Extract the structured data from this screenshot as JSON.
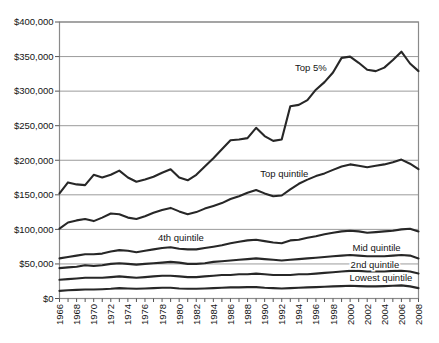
{
  "chart_data": {
    "type": "line",
    "title": "",
    "xlabel": "",
    "ylabel": "",
    "xlim": [
      1966,
      2008
    ],
    "ylim": [
      0,
      400000
    ],
    "grid": "horizontal",
    "legend": "inline-labels",
    "line_color": "#272727",
    "x": [
      1966,
      1967,
      1968,
      1969,
      1970,
      1971,
      1972,
      1973,
      1974,
      1975,
      1976,
      1977,
      1978,
      1979,
      1980,
      1981,
      1982,
      1983,
      1984,
      1985,
      1986,
      1987,
      1988,
      1989,
      1990,
      1991,
      1992,
      1993,
      1994,
      1995,
      1996,
      1997,
      1998,
      1999,
      2000,
      2001,
      2002,
      2003,
      2004,
      2005,
      2006,
      2007,
      2008
    ],
    "x_tick_values": [
      1966,
      1968,
      1970,
      1972,
      1974,
      1976,
      1978,
      1980,
      1982,
      1984,
      1986,
      1988,
      1990,
      1992,
      1994,
      1996,
      1998,
      2000,
      2002,
      2004,
      2006,
      2008
    ],
    "x_tick_labels": [
      "1966",
      "1968",
      "1970",
      "1972",
      "1974",
      "1976",
      "1978",
      "1980",
      "1982",
      "1984",
      "1986",
      "1988",
      "1990",
      "1992",
      "1994",
      "1996",
      "1998",
      "2000",
      "2002",
      "2004",
      "2006",
      "2008"
    ],
    "y_ticks": {
      "values": [
        0,
        50000,
        100000,
        150000,
        200000,
        250000,
        300000,
        350000,
        400000
      ],
      "labels": [
        "$0",
        "$50,000",
        "$100,000",
        "$150,000",
        "$200,000",
        "$250,000",
        "$300,000",
        "$350,000",
        "$400,000"
      ]
    },
    "series": [
      {
        "name": "Top 5%",
        "label": {
          "text": "Top 5%",
          "x": 1995.4,
          "y": 334000
        },
        "values": [
          152000,
          168000,
          165000,
          164000,
          179000,
          175000,
          179000,
          185000,
          175000,
          169000,
          172000,
          176000,
          182000,
          187000,
          175000,
          171000,
          179000,
          191000,
          203000,
          216000,
          229000,
          230000,
          232000,
          247000,
          235000,
          228000,
          230000,
          278000,
          280000,
          287000,
          302000,
          313000,
          327000,
          348000,
          350000,
          341000,
          331000,
          329000,
          334000,
          345000,
          357000,
          340000,
          329000
        ]
      },
      {
        "name": "Top quintile",
        "label": {
          "text": "Top quintile",
          "x": 1992.3,
          "y": 180000
        },
        "values": [
          101000,
          110000,
          113000,
          115000,
          112000,
          117000,
          123000,
          122000,
          117000,
          115000,
          119000,
          124000,
          128000,
          131000,
          126000,
          122000,
          125000,
          130000,
          134000,
          138000,
          144000,
          148000,
          153000,
          157000,
          152000,
          148000,
          149000,
          158000,
          166000,
          172000,
          177000,
          181000,
          186000,
          191000,
          194000,
          192000,
          190000,
          192000,
          194000,
          197000,
          201000,
          195000,
          187000
        ]
      },
      {
        "name": "4th quintile",
        "label": {
          "text": "4th quintile",
          "x": 1980.2,
          "y": 87500
        },
        "values": [
          58000,
          60000,
          62000,
          64000,
          64000,
          65000,
          68000,
          70000,
          69000,
          67000,
          69000,
          71000,
          73000,
          74000,
          72000,
          71000,
          71000,
          73000,
          75000,
          77000,
          80000,
          82000,
          84000,
          85000,
          83000,
          81000,
          80000,
          84000,
          85000,
          88000,
          90000,
          93000,
          95000,
          97000,
          98000,
          97000,
          95000,
          96000,
          97000,
          98000,
          100000,
          101000,
          97000
        ]
      },
      {
        "name": "Mid quintile",
        "label": {
          "text": "Mid quintile",
          "x": 2003.1,
          "y": 73000
        },
        "values": [
          44000,
          45000,
          46000,
          48000,
          47000,
          48000,
          50000,
          51000,
          50000,
          49000,
          50000,
          51000,
          52000,
          53000,
          52000,
          50000,
          50000,
          51000,
          53000,
          54000,
          55000,
          56000,
          57000,
          58000,
          57000,
          56000,
          55000,
          56000,
          57000,
          58000,
          59000,
          60000,
          61000,
          62000,
          63000,
          62000,
          61000,
          61000,
          61000,
          62000,
          63000,
          62000,
          58000
        ]
      },
      {
        "name": "2nd quintile",
        "label": {
          "text": "2nd quintile",
          "x": 2002.9,
          "y": 48500
        },
        "values": [
          27000,
          28000,
          29000,
          30000,
          30000,
          30000,
          31000,
          32000,
          31000,
          30000,
          31000,
          32000,
          33000,
          33000,
          32000,
          31000,
          31000,
          32000,
          33000,
          34000,
          34000,
          35000,
          35000,
          36000,
          35000,
          34000,
          34000,
          34000,
          35000,
          35000,
          36000,
          37000,
          38000,
          39000,
          40000,
          40000,
          39000,
          39000,
          39000,
          40000,
          40000,
          39000,
          36000
        ]
      },
      {
        "name": "Lowest quintile",
        "label": {
          "text": "Lowest quintile",
          "x": 2003.6,
          "y": 30500
        },
        "values": [
          11000,
          12000,
          12500,
          13000,
          13000,
          13500,
          14000,
          15000,
          14500,
          14000,
          14500,
          15000,
          15500,
          15500,
          14500,
          14000,
          14000,
          14500,
          15000,
          15500,
          16000,
          16000,
          16500,
          16500,
          15500,
          15000,
          14500,
          15000,
          15500,
          16000,
          16500,
          17000,
          17500,
          18000,
          18500,
          18000,
          17500,
          17500,
          18000,
          18500,
          19000,
          17500,
          15000
        ]
      }
    ],
    "style_colors": {
      "series_line": "#272727",
      "gridline": "#9b9b9b",
      "frame": "#8a8a8a",
      "tick": "#555555",
      "text": "#141414",
      "background": "#ffffff"
    }
  }
}
